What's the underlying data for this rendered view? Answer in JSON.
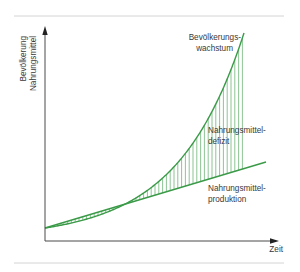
{
  "chart_data": {
    "type": "line",
    "title": "",
    "xlabel": "Zeit",
    "ylabel_lines": [
      "Bevölkerung",
      "Nahrungsmittel"
    ],
    "grid": false,
    "legend": "none (inline annotations)",
    "series": [
      {
        "name": "Bevölkerungswachstum",
        "label_lines": [
          "Bevölkerungs-",
          "wachstum"
        ],
        "shape": "exponential",
        "color": "#3a9a48",
        "x": [
          0,
          0.2,
          0.4,
          0.6,
          0.8,
          1.0
        ],
        "values": [
          0,
          0.06,
          0.16,
          0.33,
          0.58,
          1.0
        ]
      },
      {
        "name": "Nahrungsmittelproduktion",
        "label_lines": [
          "Nahrungsmittel-",
          "produktion"
        ],
        "shape": "linear",
        "color": "#3a9a48",
        "x": [
          0,
          1.12
        ],
        "values": [
          0,
          0.34
        ]
      }
    ],
    "annotations": [
      {
        "text_lines": [
          "Nahrungsmittel-",
          "defizit"
        ],
        "meaning": "hatched area between curves"
      }
    ]
  },
  "colors": {
    "curve": "#3a9a48",
    "hatch": "#5aac66",
    "axis": "#4a4a4a",
    "rule": "#cfcfcf",
    "text": "#3a3a3a"
  }
}
